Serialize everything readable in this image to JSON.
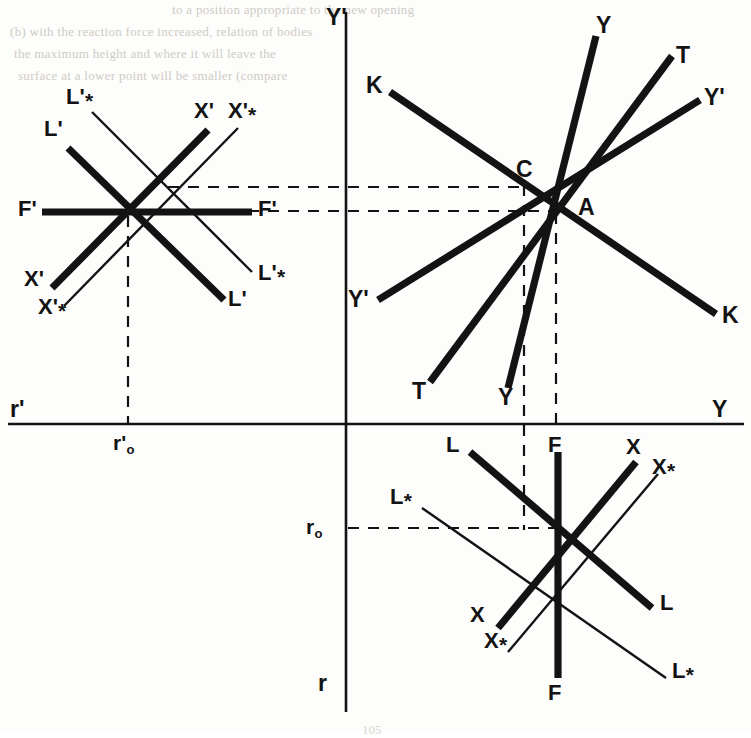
{
  "figure": {
    "kind": "technical-line-diagram"
  },
  "axes": {
    "vertical_top_label": "Y'",
    "vertical_bottom_label": "r",
    "horizontal_left_label": "r'",
    "horizontal_right_label": "Y",
    "origin_px": [
      346,
      424
    ],
    "vertical_x": 346,
    "horizontal_y": 424
  },
  "tick_labels": {
    "r_prime_zero": {
      "base": "r",
      "prime": "'",
      "sub": "o"
    },
    "r_zero": {
      "base": "r",
      "prime": "",
      "sub": "o"
    }
  },
  "points": [
    {
      "name": "A",
      "label": "A",
      "x": 556,
      "y": 211
    },
    {
      "name": "C",
      "label": "C",
      "x": 524,
      "y": 187
    }
  ],
  "clusters": [
    {
      "name": "upper-left-primed-rosette",
      "center": [
        128,
        212
      ],
      "lines": [
        {
          "id": "F-prime",
          "label": "F'",
          "label2": "F'",
          "weight": "thick"
        },
        {
          "id": "L-prime",
          "label": "L'",
          "label2": "L'",
          "weight": "thick"
        },
        {
          "id": "L-prime-star",
          "label": "L'*",
          "label2": "L'*",
          "weight": "thin"
        },
        {
          "id": "X-prime",
          "label": "X'",
          "label2": "X'",
          "weight": "thick"
        },
        {
          "id": "X-prime-star",
          "label": "X'*",
          "label2": "X'*",
          "weight": "thin"
        }
      ]
    },
    {
      "name": "upper-right-A-rosette",
      "center": [
        556,
        211
      ],
      "lines": [
        {
          "id": "Y",
          "label": "Y",
          "label2": "Y",
          "weight": "thick"
        },
        {
          "id": "T",
          "label": "T",
          "label2": "T",
          "weight": "thick"
        },
        {
          "id": "Y-prime",
          "label": "Y'",
          "label2": "Y'",
          "weight": "thick"
        },
        {
          "id": "K",
          "label": "K",
          "label2": "K",
          "weight": "thick"
        }
      ]
    },
    {
      "name": "lower-right-rosette",
      "center": [
        558,
        528
      ],
      "lines": [
        {
          "id": "F",
          "label": "F",
          "label2": "F",
          "weight": "thick"
        },
        {
          "id": "L",
          "label": "L",
          "label2": "L",
          "weight": "thick"
        },
        {
          "id": "L-star",
          "label": "L*",
          "label2": "L*",
          "weight": "thin"
        },
        {
          "id": "X",
          "label": "X",
          "label2": "X",
          "weight": "thick"
        },
        {
          "id": "X-star",
          "label": "X*",
          "label2": "X*",
          "weight": "thin"
        }
      ]
    }
  ],
  "labels": {
    "y_prime_top": "Y'",
    "y_right": "Y",
    "r_prime_left": "r'",
    "r_bottom": "r",
    "A": "A",
    "C": "C",
    "K_upper": "K",
    "K_lower": "K",
    "Y_upper": "Y",
    "Y_lower": "Y",
    "T_upper": "T",
    "T_lower": "T",
    "Yp_right": "Y'",
    "Yp_left": "Y'",
    "Fp_left": "F'",
    "Fp_right": "F'",
    "Lp_ul": "L'",
    "Lp_lr": "L'",
    "Lps_ul": "L'",
    "Lps_lr": "L'",
    "Xp_ur": "X'",
    "Xp_ll": "X'",
    "Xps_ur": "X'",
    "Xps_ll": "X'",
    "L_ul": "L",
    "L_lr": "L",
    "Ls_ul": "L",
    "Ls_lr": "L",
    "X_ur": "X",
    "X_ll": "X",
    "Xs_ur": "X",
    "Xs_ll": "X",
    "F_top": "F",
    "F_bottom": "F",
    "star": "*"
  },
  "dashed_guides": [
    {
      "id": "h-C",
      "from": [
        175,
        187
      ],
      "to": [
        524,
        187
      ]
    },
    {
      "id": "h-A-Fprime",
      "from": [
        175,
        211
      ],
      "to": [
        556,
        211
      ]
    },
    {
      "id": "v-C",
      "from": [
        524,
        187
      ],
      "to": [
        524,
        528
      ]
    },
    {
      "id": "v-A",
      "from": [
        556,
        211
      ],
      "to": [
        556,
        424
      ]
    },
    {
      "id": "v-rprime0",
      "from": [
        128,
        212
      ],
      "to": [
        128,
        424
      ]
    },
    {
      "id": "h-r0",
      "from": [
        346,
        528
      ],
      "to": [
        558,
        528
      ]
    }
  ],
  "page_number": "105",
  "colors": {
    "ink": "#131313",
    "paper": "#fdfdfc",
    "ghost_text": "#cfcbc4"
  },
  "ghost_text_lines": [
    "to a position appropriate to the new opening",
    "(b) with the reaction force increased, relation of bodies",
    "the maximum height and where it will leave the",
    "surface at a lower point will be smaller (compare"
  ]
}
